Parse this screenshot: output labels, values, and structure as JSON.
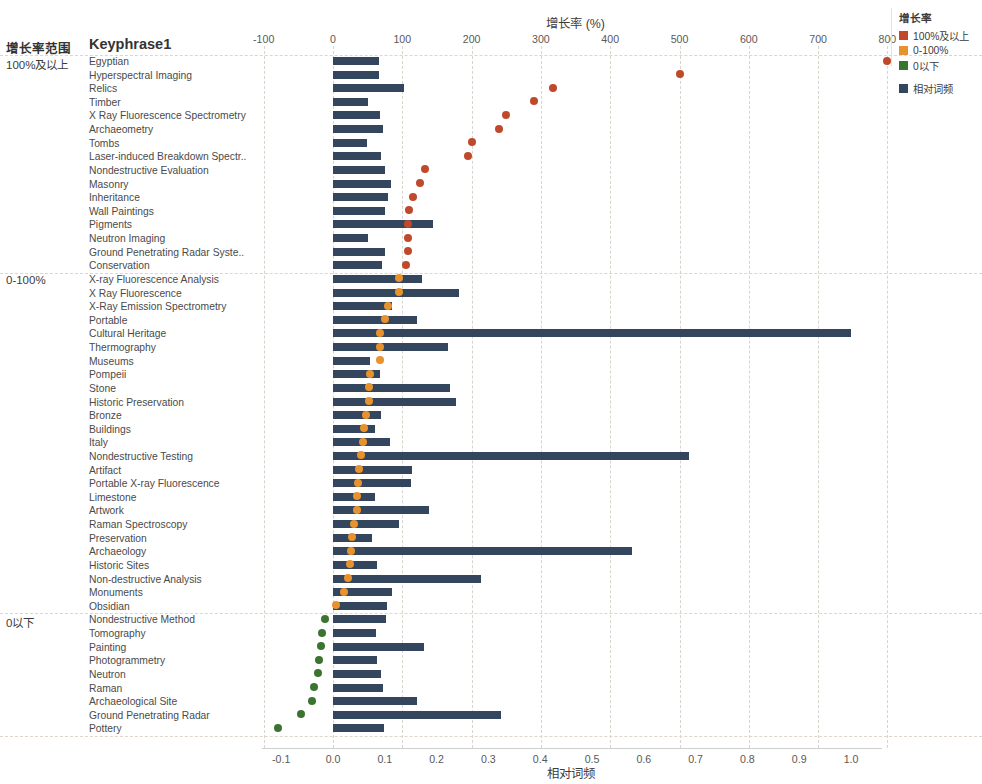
{
  "headers": {
    "range_col": "增长率范围",
    "keyphrase_col": "Keyphrase1"
  },
  "legend": {
    "title": "增长率",
    "items": [
      {
        "label": "100%及以上",
        "color": "#c0492c"
      },
      {
        "label": "0-100%",
        "color": "#e8922e"
      },
      {
        "label": "0以下",
        "color": "#3a7430"
      }
    ],
    "bar_item": {
      "label": "相对词频",
      "color": "#34465e"
    }
  },
  "chart_data": {
    "type": "bar",
    "title": "增长率 (%)",
    "xlabel_top": "增长率 (%)",
    "xlabel_bottom": "相对词频",
    "ylabel": "Keyphrase1",
    "grid": true,
    "legend_position": "top-right",
    "top_axis": {
      "label": "增长率 (%)",
      "ticks": [
        -100,
        0,
        100,
        200,
        300,
        400,
        500,
        600,
        700,
        800
      ],
      "tick_labels": [
        "-100",
        "0",
        "100",
        "200",
        "300",
        "400",
        "500",
        "600",
        "700",
        "800"
      ],
      "xlim": [
        -140,
        830
      ]
    },
    "bottom_axis": {
      "label": "相对词频",
      "ticks": [
        -0.1,
        0.0,
        0.1,
        0.2,
        0.3,
        0.4,
        0.5,
        0.6,
        0.7,
        0.8,
        0.9,
        1.0
      ],
      "tick_labels": [
        "-0.1",
        "0.0",
        "0.1",
        "0.2",
        "0.3",
        "0.4",
        "0.5",
        "0.6",
        "0.7",
        "0.8",
        "0.9",
        "1.0"
      ],
      "xlim": [
        -0.14,
        1.07
      ]
    },
    "groups": [
      {
        "name": "100%及以上",
        "dot_color": "#c0492c",
        "rows": [
          {
            "keyphrase": "Egyptian",
            "relative_frequency": 0.088,
            "growth_rate": 800
          },
          {
            "keyphrase": "Hyperspectral Imaging",
            "relative_frequency": 0.088,
            "growth_rate": 500
          },
          {
            "keyphrase": "Relics",
            "relative_frequency": 0.137,
            "growth_rate": 318
          },
          {
            "keyphrase": "Timber",
            "relative_frequency": 0.068,
            "growth_rate": 290
          },
          {
            "keyphrase": "X Ray Fluorescence Spectrometry",
            "relative_frequency": 0.09,
            "growth_rate": 250
          },
          {
            "keyphrase": "Archaeometry",
            "relative_frequency": 0.097,
            "growth_rate": 240
          },
          {
            "keyphrase": "Tombs",
            "relative_frequency": 0.066,
            "growth_rate": 200
          },
          {
            "keyphrase": "Laser-induced Breakdown Spectr..",
            "relative_frequency": 0.093,
            "growth_rate": 195
          },
          {
            "keyphrase": "Nondestructive Evaluation",
            "relative_frequency": 0.101,
            "growth_rate": 133
          },
          {
            "keyphrase": "Masonry",
            "relative_frequency": 0.112,
            "growth_rate": 125
          },
          {
            "keyphrase": "Inheritance",
            "relative_frequency": 0.107,
            "growth_rate": 115
          },
          {
            "keyphrase": "Wall Paintings",
            "relative_frequency": 0.1,
            "growth_rate": 110
          },
          {
            "keyphrase": "Pigments",
            "relative_frequency": 0.193,
            "growth_rate": 108
          },
          {
            "keyphrase": "Neutron Imaging",
            "relative_frequency": 0.068,
            "growth_rate": 108
          },
          {
            "keyphrase": "Ground Penetrating Radar Syste..",
            "relative_frequency": 0.101,
            "growth_rate": 108
          },
          {
            "keyphrase": "Conservation",
            "relative_frequency": 0.094,
            "growth_rate": 105
          }
        ]
      },
      {
        "name": "0-100%",
        "dot_color": "#e8922e",
        "rows": [
          {
            "keyphrase": "X-ray Fluorescence Analysis",
            "relative_frequency": 0.172,
            "growth_rate": 95
          },
          {
            "keyphrase": "X Ray Fluorescence",
            "relative_frequency": 0.243,
            "growth_rate": 95
          },
          {
            "keyphrase": "X-Ray Emission Spectrometry",
            "relative_frequency": 0.113,
            "growth_rate": 80
          },
          {
            "keyphrase": "Portable",
            "relative_frequency": 0.162,
            "growth_rate": 75
          },
          {
            "keyphrase": "Cultural Heritage",
            "relative_frequency": 1.0,
            "growth_rate": 68
          },
          {
            "keyphrase": "Thermography",
            "relative_frequency": 0.222,
            "growth_rate": 68
          },
          {
            "keyphrase": "Museums",
            "relative_frequency": 0.072,
            "growth_rate": 68
          },
          {
            "keyphrase": "Pompeii",
            "relative_frequency": 0.091,
            "growth_rate": 54
          },
          {
            "keyphrase": "Stone",
            "relative_frequency": 0.226,
            "growth_rate": 52
          },
          {
            "keyphrase": "Historic Preservation",
            "relative_frequency": 0.237,
            "growth_rate": 52
          },
          {
            "keyphrase": "Bronze",
            "relative_frequency": 0.093,
            "growth_rate": 48
          },
          {
            "keyphrase": "Buildings",
            "relative_frequency": 0.082,
            "growth_rate": 45
          },
          {
            "keyphrase": "Italy",
            "relative_frequency": 0.11,
            "growth_rate": 43
          },
          {
            "keyphrase": "Nondestructive Testing",
            "relative_frequency": 0.688,
            "growth_rate": 40
          },
          {
            "keyphrase": "Artifact",
            "relative_frequency": 0.152,
            "growth_rate": 38
          },
          {
            "keyphrase": "Portable X-ray Fluorescence",
            "relative_frequency": 0.151,
            "growth_rate": 36
          },
          {
            "keyphrase": "Limestone",
            "relative_frequency": 0.082,
            "growth_rate": 35
          },
          {
            "keyphrase": "Artwork",
            "relative_frequency": 0.186,
            "growth_rate": 35
          },
          {
            "keyphrase": "Raman Spectroscopy",
            "relative_frequency": 0.128,
            "growth_rate": 30
          },
          {
            "keyphrase": "Preservation",
            "relative_frequency": 0.075,
            "growth_rate": 28
          },
          {
            "keyphrase": "Archaeology",
            "relative_frequency": 0.578,
            "growth_rate": 26
          },
          {
            "keyphrase": "Historic Sites",
            "relative_frequency": 0.084,
            "growth_rate": 24
          },
          {
            "keyphrase": "Non-destructive Analysis",
            "relative_frequency": 0.285,
            "growth_rate": 21
          },
          {
            "keyphrase": "Monuments",
            "relative_frequency": 0.113,
            "growth_rate": 16
          },
          {
            "keyphrase": "Obsidian",
            "relative_frequency": 0.104,
            "growth_rate": 4
          }
        ]
      },
      {
        "name": "0以下",
        "dot_color": "#3a7430",
        "rows": [
          {
            "keyphrase": "Nondestructive Method",
            "relative_frequency": 0.102,
            "growth_rate": -11
          },
          {
            "keyphrase": "Tomography",
            "relative_frequency": 0.083,
            "growth_rate": -16
          },
          {
            "keyphrase": "Painting",
            "relative_frequency": 0.176,
            "growth_rate": -18
          },
          {
            "keyphrase": "Photogrammetry",
            "relative_frequency": 0.085,
            "growth_rate": -20
          },
          {
            "keyphrase": "Neutron",
            "relative_frequency": 0.093,
            "growth_rate": -22
          },
          {
            "keyphrase": "Raman",
            "relative_frequency": 0.097,
            "growth_rate": -28
          },
          {
            "keyphrase": "Archaeological Site",
            "relative_frequency": 0.163,
            "growth_rate": -31
          },
          {
            "keyphrase": "Ground Penetrating Radar",
            "relative_frequency": 0.325,
            "growth_rate": -46
          },
          {
            "keyphrase": "Pottery",
            "relative_frequency": 0.098,
            "growth_rate": -80
          }
        ]
      }
    ]
  }
}
